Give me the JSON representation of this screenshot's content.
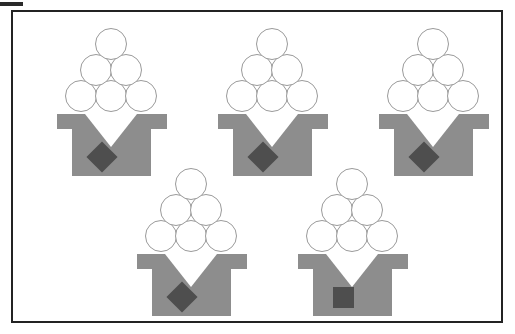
{
  "canvas": {
    "width": 515,
    "height": 334,
    "background_color": "#ffffff",
    "description": "Scanned black-and-white figure showing five gray ice-cream-cone style icons inside a rectangular frame"
  },
  "corner_mark": {
    "name": "scan-artifact-bar",
    "color": "#2a2a2a",
    "label": ""
  },
  "frame": {
    "border_color": "#232323",
    "border_width_px": 2,
    "fill_color": "#ffffff"
  },
  "palette": {
    "body_gray": "#8d8d8d",
    "emblem_dark": "#4e4e4e",
    "circle_fill": "#ffffff",
    "circle_outline": "#9a9a9a",
    "notch_white": "#ffffff",
    "frame_black": "#232323"
  },
  "figures": [
    {
      "id": "figure-1",
      "position": "top-left",
      "left": 57,
      "top": 28,
      "ball_count": 6,
      "ball_rows": [
        3,
        2,
        1
      ],
      "emblem": "diamond",
      "emblem_label": "diamond",
      "is_odd_one_out": false
    },
    {
      "id": "figure-2",
      "position": "top-center",
      "left": 218,
      "top": 28,
      "ball_count": 6,
      "ball_rows": [
        3,
        2,
        1
      ],
      "emblem": "diamond",
      "emblem_label": "diamond",
      "is_odd_one_out": false
    },
    {
      "id": "figure-3",
      "position": "top-right",
      "left": 379,
      "top": 28,
      "ball_count": 6,
      "ball_rows": [
        3,
        2,
        1
      ],
      "emblem": "diamond",
      "emblem_label": "diamond",
      "is_odd_one_out": false
    },
    {
      "id": "figure-4",
      "position": "bottom-left",
      "left": 137,
      "top": 168,
      "ball_count": 6,
      "ball_rows": [
        3,
        2,
        1
      ],
      "emblem": "diamond",
      "emblem_label": "diamond",
      "is_odd_one_out": false
    },
    {
      "id": "figure-5",
      "position": "bottom-right",
      "left": 298,
      "top": 168,
      "ball_count": 6,
      "ball_rows": [
        3,
        2,
        1
      ],
      "emblem": "square",
      "emblem_label": "square",
      "is_odd_one_out": true
    }
  ]
}
